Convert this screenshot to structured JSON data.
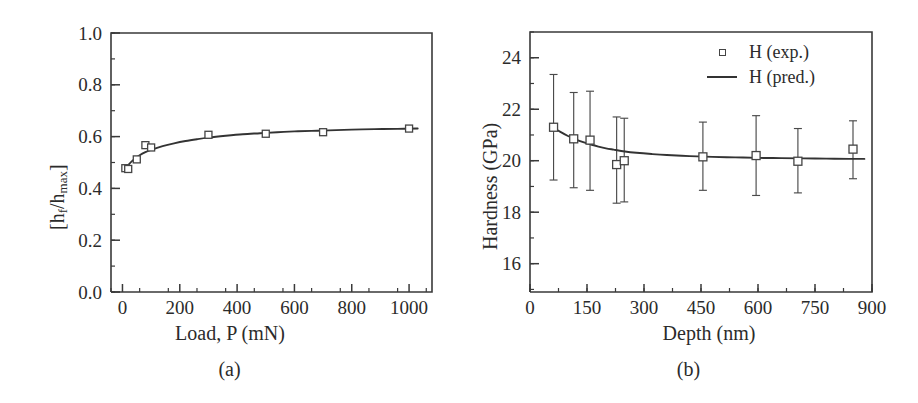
{
  "figure": {
    "panel_a_caption": "(a)",
    "panel_b_caption": "(b)"
  },
  "chart_data": [
    {
      "type": "scatter",
      "panel": "a",
      "title": "",
      "xlabel": "Load, P (mN)",
      "ylabel": "[h_f/h_max]",
      "ylabel_parts": {
        "pre": "[h",
        "sub1": "f",
        "mid": "/h",
        "sub2": "max",
        "post": "]"
      },
      "xlim": [
        -40,
        1080
      ],
      "ylim": [
        0.0,
        1.0
      ],
      "xticks": [
        0,
        200,
        400,
        600,
        800,
        1000
      ],
      "xtick_labels": [
        "0",
        "200",
        "400",
        "600",
        "800",
        "1000"
      ],
      "yticks": [
        0.0,
        0.2,
        0.4,
        0.6,
        0.8,
        1.0
      ],
      "ytick_labels": [
        "0.0",
        "0.2",
        "0.4",
        "0.6",
        "0.8",
        "1.0"
      ],
      "x_minor_step": 100,
      "y_minor_step": 0.1,
      "grid": false,
      "legend": null,
      "series": [
        {
          "name": "hf/hmax (exp.)",
          "marker": "open-square",
          "x": [
            10,
            20,
            50,
            80,
            100,
            300,
            500,
            700,
            1000
          ],
          "y": [
            0.478,
            0.475,
            0.512,
            0.567,
            0.558,
            0.607,
            0.611,
            0.617,
            0.631
          ]
        },
        {
          "name": "hf/hmax (fit)",
          "marker": "line",
          "x": [
            8,
            20,
            40,
            60,
            80,
            100,
            140,
            180,
            220,
            260,
            300,
            360,
            420,
            480,
            540,
            600,
            660,
            720,
            800,
            880,
            960,
            1030
          ],
          "y": [
            0.472,
            0.49,
            0.512,
            0.528,
            0.54,
            0.549,
            0.563,
            0.574,
            0.583,
            0.59,
            0.596,
            0.603,
            0.609,
            0.613,
            0.617,
            0.62,
            0.622,
            0.624,
            0.627,
            0.629,
            0.63,
            0.631
          ]
        }
      ]
    },
    {
      "type": "scatter",
      "panel": "b",
      "title": "",
      "xlabel": "Depth (nm)",
      "ylabel": "Hardness (GPa)",
      "xlim": [
        0,
        900
      ],
      "ylim": [
        14.9,
        25.0
      ],
      "xticks": [
        0,
        150,
        300,
        450,
        600,
        750,
        900
      ],
      "xtick_labels": [
        "0",
        "150",
        "300",
        "450",
        "600",
        "750",
        "900"
      ],
      "yticks": [
        16,
        18,
        20,
        22,
        24
      ],
      "ytick_labels": [
        "16",
        "18",
        "20",
        "22",
        "24"
      ],
      "x_minor_step": 75,
      "y_minor_step": 1,
      "grid": false,
      "legend": {
        "position": "top-right",
        "entries": [
          {
            "label": "H (exp.)",
            "key": "open-square"
          },
          {
            "label": "H (pred.)",
            "key": "line"
          }
        ]
      },
      "series": [
        {
          "name": "H (exp.)",
          "marker": "open-square",
          "x": [
            62,
            115,
            158,
            228,
            248,
            455,
            595,
            705,
            850
          ],
          "y": [
            21.3,
            20.85,
            20.8,
            19.85,
            20.0,
            20.15,
            20.2,
            19.98,
            20.45
          ],
          "yerr_low": [
            19.25,
            18.95,
            18.85,
            18.35,
            18.4,
            18.85,
            18.65,
            18.75,
            19.3
          ],
          "yerr_high": [
            23.35,
            22.65,
            22.7,
            21.7,
            21.65,
            21.5,
            21.75,
            21.25,
            21.55
          ]
        },
        {
          "name": "H (pred.)",
          "marker": "line",
          "x": [
            60,
            80,
            100,
            120,
            140,
            160,
            180,
            200,
            220,
            250,
            280,
            320,
            360,
            420,
            480,
            540,
            600,
            660,
            720,
            780,
            840,
            880
          ],
          "y": [
            21.3,
            21.12,
            20.96,
            20.83,
            20.72,
            20.63,
            20.55,
            20.48,
            20.43,
            20.36,
            20.31,
            20.26,
            20.22,
            20.18,
            20.15,
            20.13,
            20.11,
            20.1,
            20.09,
            20.08,
            20.07,
            20.07
          ]
        }
      ]
    }
  ]
}
